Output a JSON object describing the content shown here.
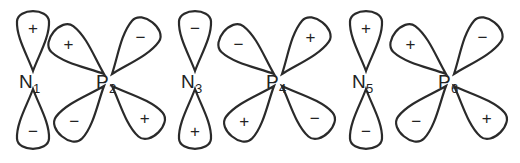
{
  "diagram": {
    "atoms": [
      {
        "id": "N1",
        "element": "N",
        "index": "1",
        "orbital": "p",
        "x": 33,
        "lobes": [
          {
            "pos": "top",
            "sign": "+"
          },
          {
            "pos": "bottom",
            "sign": "−"
          }
        ]
      },
      {
        "id": "P2",
        "element": "P",
        "index": "2",
        "orbital": "d",
        "x": 108,
        "lobes": [
          {
            "pos": "upper-left",
            "sign": "+"
          },
          {
            "pos": "upper-right",
            "sign": "−"
          },
          {
            "pos": "lower-left",
            "sign": "−"
          },
          {
            "pos": "lower-right",
            "sign": "+"
          }
        ]
      },
      {
        "id": "N3",
        "element": "N",
        "index": "3",
        "orbital": "p",
        "x": 195,
        "lobes": [
          {
            "pos": "top",
            "sign": "−"
          },
          {
            "pos": "bottom",
            "sign": "+"
          }
        ]
      },
      {
        "id": "P4",
        "element": "P",
        "index": "4",
        "orbital": "d",
        "x": 278,
        "lobes": [
          {
            "pos": "upper-left",
            "sign": "−"
          },
          {
            "pos": "upper-right",
            "sign": "+"
          },
          {
            "pos": "lower-left",
            "sign": "+"
          },
          {
            "pos": "lower-right",
            "sign": "−"
          }
        ]
      },
      {
        "id": "N5",
        "element": "N",
        "index": "5",
        "orbital": "p",
        "x": 366,
        "lobes": [
          {
            "pos": "top",
            "sign": "+"
          },
          {
            "pos": "bottom",
            "sign": "−"
          }
        ]
      },
      {
        "id": "P6",
        "element": "P",
        "index": "6",
        "orbital": "d",
        "x": 450,
        "lobes": [
          {
            "pos": "upper-left",
            "sign": "+"
          },
          {
            "pos": "upper-right",
            "sign": "−"
          },
          {
            "pos": "lower-left",
            "sign": "−"
          },
          {
            "pos": "lower-right",
            "sign": "+"
          }
        ]
      }
    ]
  }
}
